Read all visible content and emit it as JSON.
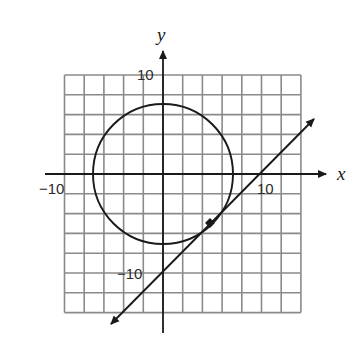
{
  "figure": {
    "type": "coordinate-plane",
    "axes": {
      "x_label": "x",
      "y_label": "y",
      "tick_labels": {
        "x_neg": "−10",
        "x_pos": "10",
        "y_pos": "10",
        "y_neg": "−10"
      }
    },
    "grid": {
      "x_range": [
        -10,
        14
      ],
      "y_range": [
        -14,
        10
      ],
      "cell_size_units": 2
    },
    "circle": {
      "center": [
        0,
        0
      ],
      "radius": 7.07,
      "equation": "x^2 + y^2 = 50"
    },
    "line": {
      "equation": "y = x - 10",
      "slope": 1,
      "y_intercept": -10,
      "x_intercept": 10,
      "arrows": "both"
    },
    "tangent_point": {
      "coords": [
        5,
        -5
      ],
      "marker": "filled-dot"
    },
    "colors": {
      "ink": "#1a1a1a",
      "grid": "#8a8a8a",
      "background": "#ffffff"
    }
  }
}
